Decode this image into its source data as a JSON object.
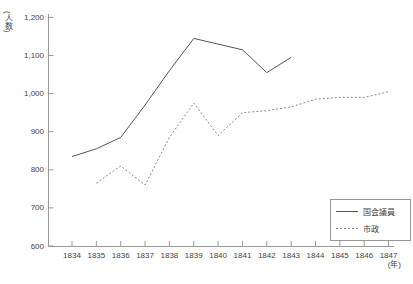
{
  "chart_data": {
    "type": "line",
    "title": "",
    "xlabel": "(年)",
    "ylabel": "(人数)",
    "x_categories": [
      "1834",
      "1835",
      "1836",
      "1837",
      "1838",
      "1839",
      "1840",
      "1841",
      "1842",
      "1843",
      "1844",
      "1845",
      "1846",
      "1847"
    ],
    "ylim": [
      600,
      1200
    ],
    "ytick_values": [
      600,
      700,
      800,
      900,
      1000,
      1100,
      1200
    ],
    "ytick_labels": [
      "600",
      "700",
      "800",
      "900",
      "1,000",
      "1,100",
      "1,200"
    ],
    "grid": "off",
    "legend_position": "bottom-right-inside",
    "axis_color": "#999999",
    "series": [
      {
        "name": "国会議員",
        "line_style": "solid",
        "color": "#555555",
        "values": [
          835,
          855,
          885,
          970,
          1060,
          1145,
          1130,
          1115,
          1055,
          1095,
          null,
          null,
          null,
          null
        ]
      },
      {
        "name": "市政",
        "line_style": "dashed",
        "color": "#888888",
        "values": [
          null,
          765,
          810,
          760,
          885,
          975,
          890,
          950,
          955,
          965,
          985,
          990,
          990,
          1005
        ]
      }
    ]
  }
}
